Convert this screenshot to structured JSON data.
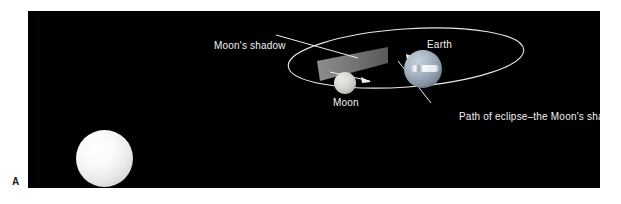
{
  "figure": {
    "panel_letter": "A",
    "background_color": "#000000",
    "page_color": "#ffffff"
  },
  "labels": {
    "moons_shadow": "Moon's shadow",
    "earth": "Earth",
    "moon": "Moon",
    "eclipse_path_caption": "Path of eclipse–the Moon's shadow"
  },
  "bodies": {
    "sun": {
      "name": "Sun",
      "color": "#ffffff"
    },
    "earth": {
      "name": "Earth",
      "color": "#a8b6c4"
    },
    "moon": {
      "name": "Moon",
      "color": "#dcdad6"
    }
  },
  "graphics": {
    "orbit_ellipse": "Moon's orbit around Earth",
    "shadow_cone": "Moon's shadow cone cast onto Earth",
    "orbit_direction_arrow": "direction of Moon's orbital motion",
    "line_color": "#f0f0f0"
  }
}
